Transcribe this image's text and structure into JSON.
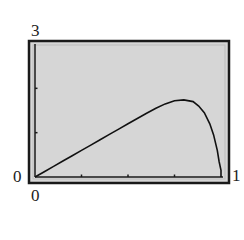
{
  "chart_data": {
    "type": "line",
    "title": "",
    "xlabel": "",
    "ylabel": "",
    "xlim": [
      0,
      1
    ],
    "ylim": [
      0,
      3
    ],
    "x_tick_labels": [
      "0",
      "1"
    ],
    "y_tick_labels": [
      "0",
      "3"
    ],
    "x_ticks": [
      0.25,
      0.5,
      0.75
    ],
    "y_ticks": [
      1,
      2
    ],
    "grid": false,
    "legend": null,
    "series": [
      {
        "name": "curve",
        "x": [
          0,
          0.05,
          0.1,
          0.15,
          0.2,
          0.25,
          0.3,
          0.35,
          0.4,
          0.45,
          0.5,
          0.55,
          0.6,
          0.65,
          0.7,
          0.75,
          0.8,
          0.85,
          0.88,
          0.91,
          0.94,
          0.96,
          0.98,
          0.99,
          1.0,
          1.0
        ],
        "y": [
          0,
          0.12,
          0.24,
          0.36,
          0.48,
          0.6,
          0.72,
          0.84,
          0.96,
          1.08,
          1.2,
          1.32,
          1.44,
          1.55,
          1.65,
          1.72,
          1.74,
          1.7,
          1.6,
          1.45,
          1.2,
          0.95,
          0.6,
          0.35,
          0.15,
          0
        ]
      }
    ],
    "colors": {
      "background": "#d6d6d6",
      "frame": "#1a1a1a",
      "curve": "#111111",
      "border_light": "#bcbcbc"
    }
  },
  "labels": {
    "y_max": "3",
    "y_min": "0",
    "x_min": "0",
    "x_max": "1"
  }
}
